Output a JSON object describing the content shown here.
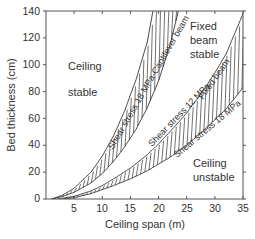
{
  "chart_data": {
    "type": "line",
    "title": "",
    "xlabel": "Ceiling span (m)",
    "ylabel": "Bed thickness (cm)",
    "xlim": [
      0,
      35
    ],
    "ylim": [
      0,
      140
    ],
    "xticks": [
      5,
      10,
      15,
      20,
      25,
      30,
      35
    ],
    "yticks": [
      0,
      20,
      40,
      60,
      80,
      100,
      120,
      140
    ],
    "grid": false,
    "legend": "none",
    "series": [
      {
        "name": "Cantilever beam - upper bound",
        "x": [
          1,
          3,
          5,
          8,
          10,
          12,
          14,
          16,
          18,
          19
        ],
        "y": [
          0,
          3,
          8,
          20,
          32,
          47,
          66,
          89,
          117,
          140
        ]
      },
      {
        "name": "Cantilever beam - Shear stress 18 MPa",
        "x": [
          1,
          3,
          5,
          8,
          10,
          12,
          14,
          16,
          18,
          20,
          22,
          23.5
        ],
        "y": [
          0,
          2,
          5,
          12,
          19,
          28,
          39,
          52,
          68,
          88,
          114,
          140
        ]
      },
      {
        "name": "Fixed beam - Shear stress 12 MPa",
        "x": [
          2,
          5,
          8,
          10,
          12,
          15,
          18,
          20,
          22,
          25,
          28,
          30,
          32,
          35
        ],
        "y": [
          0,
          2,
          6,
          10,
          15,
          23,
          33,
          41,
          50,
          64,
          81,
          94,
          108,
          138
        ]
      },
      {
        "name": "Fixed beam - Shear stress 18 MPa",
        "x": [
          3,
          5,
          8,
          10,
          12,
          15,
          18,
          20,
          22,
          25,
          28,
          30,
          32,
          35
        ],
        "y": [
          0,
          1,
          4,
          7,
          10,
          15,
          21,
          26,
          31,
          40,
          51,
          59,
          67,
          83
        ]
      }
    ],
    "annotations": [
      {
        "text": "Ceiling",
        "x": 7,
        "y": 100
      },
      {
        "text": "stable",
        "x": 7,
        "y": 81
      },
      {
        "text": "Fixed",
        "x": 28.5,
        "y": 132
      },
      {
        "text": "beam",
        "x": 28.5,
        "y": 121
      },
      {
        "text": "stable",
        "x": 28.5,
        "y": 110
      },
      {
        "text": "Ceiling",
        "x": 29,
        "y": 37
      },
      {
        "text": "unstable",
        "x": 29,
        "y": 27
      },
      {
        "text": "Shear stress 18 MPa-Cantilever beam",
        "rotated": true
      },
      {
        "text": "Shear stress 12 MPa",
        "rotated": true
      },
      {
        "text": "Fixed beam",
        "rotated": true
      },
      {
        "text": "Shear stress 18 MPa",
        "rotated": true
      }
    ]
  },
  "labels": {
    "xlabel": "Ceiling span (m)",
    "ylabel": "Bed thickness (cm)",
    "ceiling_stable_1": "Ceiling",
    "ceiling_stable_2": "stable",
    "fixed_beam_stable_1": "Fixed",
    "fixed_beam_stable_2": "beam",
    "fixed_beam_stable_3": "stable",
    "ceiling_unstable_1": "Ceiling",
    "ceiling_unstable_2": "unstable",
    "cantilever_curve": "Shear stress 18 MPa-Cantilever beam",
    "shear12_curve": "Shear stress 12 MPa",
    "fixed_beam_curve": "Fixed beam",
    "shear18_curve": "Shear stress 18 MPa"
  },
  "ticks": {
    "x": [
      "5",
      "10",
      "15",
      "20",
      "25",
      "30",
      "35"
    ],
    "y": [
      "0",
      "20",
      "40",
      "60",
      "80",
      "100",
      "120",
      "140"
    ]
  }
}
